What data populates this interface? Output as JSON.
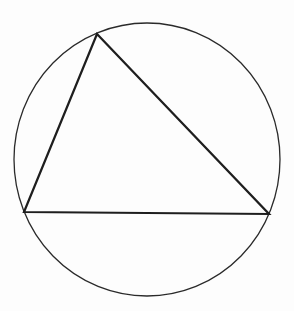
{
  "diagram": {
    "type": "inscribed-triangle",
    "colors": {
      "background": "#fdfdfd",
      "circle_stroke": "#2a2a2a",
      "triangle_stroke": "#1e1e1e"
    },
    "circle": {
      "cx": 147,
      "cy": 159.5,
      "rx": 133,
      "ry": 136.5,
      "stroke_width": 1.3
    },
    "triangle": {
      "stroke_width": 2.2,
      "vertices": [
        {
          "name": "top",
          "x": 97,
          "y": 34
        },
        {
          "name": "bottom-left",
          "x": 24,
          "y": 212
        },
        {
          "name": "bottom-right",
          "x": 269,
          "y": 214
        }
      ]
    }
  }
}
